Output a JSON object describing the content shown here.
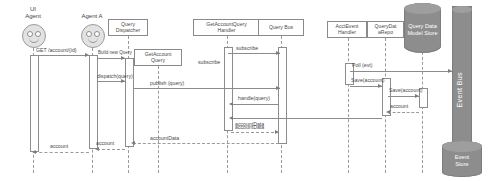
{
  "diagram": {
    "type": "uml-sequence-diagram",
    "participants": [
      {
        "id": "ui-agent",
        "label": "UI\nAgent",
        "kind": "actor",
        "x": 33,
        "lifeline_x": 33
      },
      {
        "id": "agent-a",
        "label": "Agent A",
        "kind": "actor",
        "x": 92,
        "lifeline_x": 92
      },
      {
        "id": "query-dispatcher",
        "label": "Query\nDispatcher",
        "kind": "object",
        "x": 128,
        "lifeline_x": 128
      },
      {
        "id": "getaccount-query",
        "label": "GetAccount\nQuery",
        "kind": "object",
        "x": 158,
        "lifeline_x": 158
      },
      {
        "id": "handler",
        "label": "GetAccountQuery\nHandler",
        "kind": "object",
        "x": 227,
        "lifeline_x": 227
      },
      {
        "id": "query-bus",
        "label": "Query Bus",
        "kind": "object",
        "x": 281,
        "lifeline_x": 281
      },
      {
        "id": "acct-handler",
        "label": "AcctEvent\nHandler",
        "kind": "object",
        "x": 348,
        "lifeline_x": 348
      },
      {
        "id": "query-repo",
        "label": "QueryDat\naRepo",
        "kind": "object",
        "x": 385,
        "lifeline_x": 385
      },
      {
        "id": "query-store",
        "label": "Query\nData\nModel\nStore",
        "kind": "database",
        "x": 422,
        "lifeline_x": 422
      },
      {
        "id": "event-bus",
        "label": "Event Bus",
        "kind": "bus",
        "x": 462,
        "lifeline_x": 462
      },
      {
        "id": "event-store",
        "label": "Event\nStore",
        "kind": "database",
        "x": 462,
        "lifeline_x": 462
      }
    ],
    "messages": [
      {
        "id": "m1",
        "label": "GET /account/{id}",
        "from": "ui-agent",
        "to": "agent-a",
        "kind": "call",
        "y": 55
      },
      {
        "id": "m2",
        "label": "Build new Query",
        "from": "agent-a",
        "to": "query-dispatcher",
        "kind": "call",
        "y": 54
      },
      {
        "id": "m3",
        "label": "subscribe",
        "from": "handler",
        "to": "query-bus",
        "kind": "call",
        "y": 47
      },
      {
        "id": "m4",
        "label": "subscribe",
        "from": "handler",
        "to": "query-bus",
        "kind": "note",
        "y": 61
      },
      {
        "id": "m5",
        "label": "Poll (evt)",
        "from": "acct-handler",
        "to": "event-bus",
        "kind": "call",
        "y": 63
      },
      {
        "id": "m6",
        "label": "Save(account)",
        "from": "acct-handler",
        "to": "query-repo",
        "kind": "call",
        "y": 78
      },
      {
        "id": "m7",
        "label": "Save(account)",
        "from": "query-repo",
        "to": "query-store",
        "kind": "call",
        "y": 88
      },
      {
        "id": "m8",
        "label": "dispatch(query)",
        "from": "agent-a",
        "to": "query-dispatcher",
        "kind": "call",
        "y": 75
      },
      {
        "id": "m9",
        "label": "publish (query)",
        "from": "query-dispatcher",
        "to": "query-bus",
        "kind": "call",
        "y": 82
      },
      {
        "id": "m10",
        "label": "handle(query)",
        "from": "query-bus",
        "to": "handler",
        "kind": "call",
        "y": 97
      },
      {
        "id": "m11",
        "label": "account",
        "from": "query-store",
        "to": "query-repo",
        "kind": "return",
        "y": 105
      },
      {
        "id": "m12",
        "label": "accountData",
        "from": "query-repo",
        "to": "handler",
        "kind": "call",
        "y": 112
      },
      {
        "id": "m13",
        "label": "accountData",
        "from": "handler",
        "to": "query-bus",
        "kind": "return",
        "y": 124
      },
      {
        "id": "m14",
        "label": "accountData",
        "from": "query-bus",
        "to": "query-dispatcher",
        "kind": "return",
        "y": 140
      },
      {
        "id": "m15",
        "label": "account",
        "from": "query-dispatcher",
        "to": "agent-a",
        "kind": "return",
        "y": 146
      },
      {
        "id": "m16",
        "label": "account",
        "from": "agent-a",
        "to": "ui-agent",
        "kind": "return",
        "y": 148
      }
    ],
    "labels": {
      "ui_agent": "UI\nAgent",
      "ui_agent_line1": "UI",
      "ui_agent_line2": "Agent",
      "agent_a": "Agent A",
      "query_dispatcher_l1": "Query",
      "query_dispatcher_l2": "Dispatcher",
      "getaccount_query_l1": "GetAccount",
      "getaccount_query_l2": "Query",
      "handler_l1": "GetAccountQuery",
      "handler_l2": "Handler",
      "query_bus": "Query Bus",
      "acct_handler_l1": "AcctEvent",
      "acct_handler_l2": "Handler",
      "query_repo_l1": "QueryDat",
      "query_repo_l2": "aRepo",
      "query_store": "Query Data Model Store",
      "event_bus": "Event Bus",
      "event_store_l1": "Event",
      "event_store_l2": "Store",
      "msg_get_account": "GET /account/{id}",
      "msg_build_new_query": "Build new Query",
      "msg_dispatch_query": "dispatch(query)",
      "msg_publish_query": "publish (query)",
      "msg_subscribe_top": "subscribe",
      "msg_subscribe_left": "subscribe",
      "msg_handle_query": "handle(query)",
      "msg_poll_evt": "Poll (evt)",
      "msg_save_account_1": "Save(account)",
      "msg_save_account_2": "Save(account)",
      "msg_account_store": "account",
      "msg_account_data_1": "accountData",
      "msg_account_data_2": "accountData",
      "msg_account_data_3": "accountData",
      "msg_account_1": "account",
      "msg_account_2": "account"
    },
    "colors": {
      "background": "#ffffff",
      "line": "#8c8c8c",
      "lifeline": "#9a9a9a",
      "text": "#4a4a4a",
      "database_fill": "#8d8d8d",
      "database_cap": "#9e9e9e",
      "database_text": "#ffffff",
      "actor_fill": "#e2e2e2"
    }
  }
}
